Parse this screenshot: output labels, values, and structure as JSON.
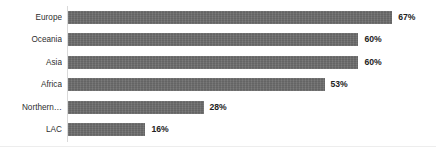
{
  "chart_data": {
    "type": "bar",
    "orientation": "horizontal",
    "title": "",
    "subtitle": "",
    "xlabel": "",
    "ylabel": "",
    "xlim": [
      0,
      70
    ],
    "grid": false,
    "legend": false,
    "value_suffix": "%",
    "categories": [
      "Europe",
      "Oceania",
      "Asia",
      "Africa",
      "Northern…",
      "LAC"
    ],
    "values": [
      67,
      60,
      60,
      53,
      28,
      16
    ],
    "value_labels": [
      "67%",
      "60%",
      "60%",
      "53%",
      "28%",
      "16%"
    ],
    "bars": [
      {
        "category": "Europe",
        "value": 67,
        "label": "67%"
      },
      {
        "category": "Oceania",
        "value": 60,
        "label": "60%"
      },
      {
        "category": "Asia",
        "value": 60,
        "label": "60%"
      },
      {
        "category": "Africa",
        "value": 53,
        "label": "53%"
      },
      {
        "category": "Northern…",
        "value": 28,
        "label": "28%"
      },
      {
        "category": "LAC",
        "value": 16,
        "label": "16%"
      }
    ]
  },
  "style": {
    "bar_color": "#6d6d6d",
    "background": "#ffffff",
    "label_color": "#2e2e2e",
    "value_color": "#222222",
    "axis_color": "#d9d9d9"
  },
  "layout": {
    "axis_x": 68,
    "first_bar_top": 11,
    "row_pitch": 22.4,
    "bar_height": 13,
    "px_per_unit": 4.84,
    "value_gap": 6
  }
}
